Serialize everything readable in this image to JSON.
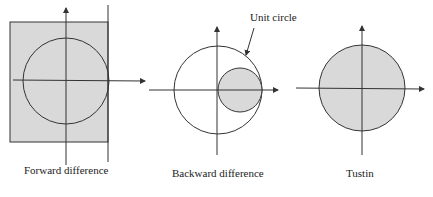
{
  "diagrams": [
    {
      "id": "forward",
      "caption": "Forward difference"
    },
    {
      "id": "backward",
      "caption": "Backward difference",
      "annotation": "Unit circle"
    },
    {
      "id": "tustin",
      "caption": "Tustin"
    }
  ],
  "colors": {
    "shade": "#d9d9d9",
    "line": "#333333"
  }
}
